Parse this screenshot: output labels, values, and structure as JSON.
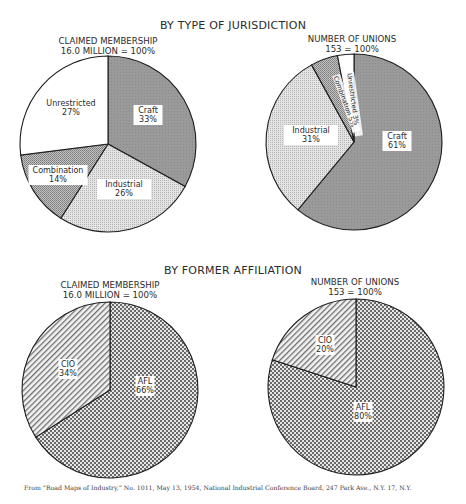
{
  "sections": [
    {
      "title": "BY TYPE OF JURISDICTION",
      "left_subtitle": [
        "CLAIMED MEMBERSHIP",
        "16.0 MILLION = 100%"
      ],
      "right_subtitle": [
        "NUMBER OF UNIONS",
        "153 = 100%"
      ]
    },
    {
      "title": "BY FORMER AFFILIATION",
      "left_subtitle": [
        "CLAIMED MEMBERSHIP",
        "16.0 MILLION = 100%"
      ],
      "right_subtitle": [
        "NUMBER OF UNIONS",
        "153 = 100%"
      ]
    }
  ],
  "source_note": "From “Road Maps of Industry,” No. 1011, May 13, 1954, National Industrial Conference Board, 247 Park Ave., N.Y. 17, N.Y.",
  "chart_data": [
    {
      "type": "pie",
      "title": "BY TYPE OF JURISDICTION — CLAIMED MEMBERSHIP",
      "subtitle": "16.0 MILLION = 100%",
      "categories": [
        "Craft",
        "Industrial",
        "Combination",
        "Unrestricted"
      ],
      "values": [
        33,
        26,
        14,
        27
      ],
      "unit": "%"
    },
    {
      "type": "pie",
      "title": "BY TYPE OF JURISDICTION — NUMBER OF UNIONS",
      "subtitle": "153 = 100%",
      "categories": [
        "Craft",
        "Industrial",
        "Combination",
        "Unrestricted"
      ],
      "values": [
        61,
        31,
        5,
        3
      ],
      "unit": "%"
    },
    {
      "type": "pie",
      "title": "BY FORMER AFFILIATION — CLAIMED MEMBERSHIP",
      "subtitle": "16.0 MILLION = 100%",
      "categories": [
        "AFL",
        "CIO"
      ],
      "values": [
        66,
        34
      ],
      "unit": "%"
    },
    {
      "type": "pie",
      "title": "BY FORMER AFFILIATION — NUMBER OF UNIONS",
      "subtitle": "153 = 100%",
      "categories": [
        "AFL",
        "CIO"
      ],
      "values": [
        80,
        20
      ],
      "unit": "%"
    }
  ],
  "pies": [
    {
      "cx": 108,
      "cy": 144,
      "r": 88,
      "slices": [
        {
          "label": "Craft",
          "value": 33,
          "pct": "33%",
          "fill": "pat-craft",
          "lx": 148,
          "ly": 113,
          "rotate": 0
        },
        {
          "label": "Industrial",
          "value": 26,
          "pct": "26%",
          "fill": "pat-industrial",
          "lx": 124,
          "ly": 187,
          "rotate": 0
        },
        {
          "label": "Combination",
          "value": 14,
          "pct": "14%",
          "fill": "pat-combination",
          "lx": 58,
          "ly": 173,
          "rotate": 0
        },
        {
          "label": "Unrestricted",
          "value": 27,
          "pct": "27%",
          "fill": "pat-white",
          "lx": 71,
          "ly": 106,
          "rotate": 0
        }
      ]
    },
    {
      "cx": 354,
      "cy": 142,
      "r": 88,
      "slices": [
        {
          "label": "Craft",
          "value": 61,
          "pct": "61%",
          "fill": "pat-craft",
          "lx": 397,
          "ly": 139,
          "rotate": 0
        },
        {
          "label": "Industrial",
          "value": 31,
          "pct": "31%",
          "fill": "pat-industrial",
          "lx": 311,
          "ly": 133,
          "rotate": 0
        },
        {
          "label": "Combination",
          "value": 5,
          "pct": "5%",
          "fill": "pat-combination",
          "lx": 336,
          "ly": 75,
          "rotate": 70,
          "inline": true
        },
        {
          "label": "Unrestricted",
          "value": 3,
          "pct": "3%",
          "fill": "pat-white",
          "lx": 350,
          "ly": 72,
          "rotate": 82,
          "inline": true
        }
      ]
    },
    {
      "cx": 110,
      "cy": 390,
      "r": 88,
      "slices": [
        {
          "label": "AFL",
          "value": 66,
          "pct": "66%",
          "fill": "pat-afl",
          "lx": 145,
          "ly": 384,
          "rotate": 0
        },
        {
          "label": "CIO",
          "value": 34,
          "pct": "34%",
          "fill": "pat-cio",
          "lx": 68,
          "ly": 367,
          "rotate": 0
        }
      ]
    },
    {
      "cx": 356,
      "cy": 387,
      "r": 88,
      "slices": [
        {
          "label": "AFL",
          "value": 80,
          "pct": "80%",
          "fill": "pat-afl",
          "lx": 363,
          "ly": 410,
          "rotate": 0
        },
        {
          "label": "CIO",
          "value": 20,
          "pct": "20%",
          "fill": "pat-cio",
          "lx": 325,
          "ly": 343,
          "rotate": 0
        }
      ]
    }
  ]
}
